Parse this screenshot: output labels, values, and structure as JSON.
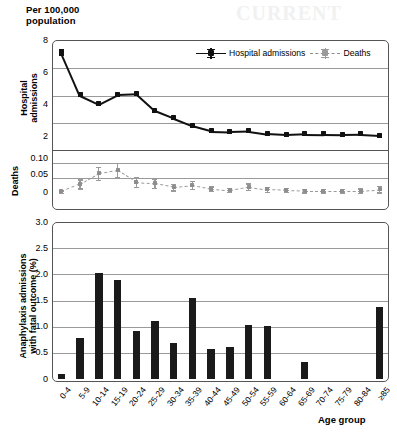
{
  "header": {
    "line1": "Per 100,000",
    "line2": "population"
  },
  "axis_titles": {
    "top_left": "Hospital\nadmissions",
    "hospital_line1": "Hospital",
    "hospital_line2": "admissions",
    "deaths": "Deaths",
    "bottom_left_line1": "Anaphylaxis admissions",
    "bottom_left_line2": "with fatal outcome (%)",
    "xaxis": "Age group"
  },
  "legend": {
    "hospital": "Hospital admissions",
    "deaths": "Deaths"
  },
  "colors": {
    "hospital_series": "#111111",
    "deaths_series": "#8e8e8e",
    "bars": "#1a1a1a",
    "grid": "#9a9a9a",
    "frame": "#555555",
    "background": "#ffffff"
  },
  "categories": [
    "0-4",
    "5-9",
    "10-14",
    "15-19",
    "20-24",
    "25-29",
    "30-34",
    "35-39",
    "40-44",
    "45-49",
    "50-54",
    "55-59",
    "60-64",
    "65-69",
    "70-74",
    "75-79",
    "80-84",
    "≥85"
  ],
  "ticks": {
    "hospital": [
      "8",
      "6",
      "4",
      "2"
    ],
    "deaths": [
      "0.10",
      "0.05",
      "0"
    ],
    "fatal": [
      "3.0",
      "2.5",
      "2.0",
      "1.5",
      "1.0",
      "0.5",
      "0"
    ]
  },
  "chart_data": [
    {
      "type": "line",
      "title": "Hospital admissions per 100,000 population",
      "ylabel": "Hospital admissions",
      "xlabel": "Age group",
      "ylim": [
        0,
        8
      ],
      "yticks": [
        0,
        2,
        4,
        6,
        8
      ],
      "grid": true,
      "legend_position": "top-right",
      "categories": [
        "0-4",
        "5-9",
        "10-14",
        "15-19",
        "20-24",
        "25-29",
        "30-34",
        "35-39",
        "40-44",
        "45-49",
        "50-54",
        "55-59",
        "60-64",
        "65-69",
        "70-74",
        "75-79",
        "80-84",
        "≥85"
      ],
      "series": [
        {
          "name": "Hospital admissions",
          "color": "#111111",
          "style": "solid",
          "values": [
            7.2,
            4.05,
            3.4,
            4.1,
            4.15,
            2.9,
            2.35,
            1.8,
            1.42,
            1.38,
            1.42,
            1.22,
            1.15,
            1.2,
            1.18,
            1.16,
            1.18,
            1.1
          ],
          "errors": [
            0.18,
            0.1,
            0.1,
            0.1,
            0.1,
            0.08,
            0.08,
            0.07,
            0.06,
            0.06,
            0.06,
            0.06,
            0.06,
            0.06,
            0.06,
            0.07,
            0.08,
            0.1
          ]
        }
      ]
    },
    {
      "type": "line",
      "title": "Deaths per 100,000 population",
      "ylabel": "Deaths",
      "xlabel": "Age group",
      "ylim": [
        0,
        0.125
      ],
      "yticks": [
        0,
        0.05,
        0.1
      ],
      "grid": true,
      "categories": [
        "0-4",
        "5-9",
        "10-14",
        "15-19",
        "20-24",
        "25-29",
        "30-34",
        "35-39",
        "40-44",
        "45-49",
        "50-54",
        "55-59",
        "60-64",
        "65-69",
        "70-74",
        "75-79",
        "80-84",
        "≥85"
      ],
      "series": [
        {
          "name": "Deaths",
          "color": "#8e8e8e",
          "style": "dashed",
          "values": [
            0.005,
            0.03,
            0.065,
            0.075,
            0.037,
            0.032,
            0.02,
            0.026,
            0.014,
            0.01,
            0.021,
            0.012,
            0.01,
            0.008,
            0.008,
            0.008,
            0.008,
            0.013
          ],
          "errors": [
            0.004,
            0.015,
            0.022,
            0.024,
            0.017,
            0.015,
            0.011,
            0.013,
            0.008,
            0.007,
            0.011,
            0.008,
            0.007,
            0.006,
            0.006,
            0.006,
            0.007,
            0.011
          ]
        }
      ]
    },
    {
      "type": "bar",
      "title": "Anaphylaxis admissions with fatal outcome (%)",
      "ylabel": "Anaphylaxis admissions with fatal outcome (%)",
      "xlabel": "Age group",
      "ylim": [
        0,
        3.0
      ],
      "yticks": [
        0,
        0.5,
        1.0,
        1.5,
        2.0,
        2.5,
        3.0
      ],
      "grid": true,
      "categories": [
        "0-4",
        "5-9",
        "10-14",
        "15-19",
        "20-24",
        "25-29",
        "30-34",
        "35-39",
        "40-44",
        "45-49",
        "50-54",
        "55-59",
        "60-64",
        "65-69",
        "70-74",
        "75-79",
        "80-84",
        "≥85"
      ],
      "values": [
        0.1,
        0.78,
        2.02,
        1.89,
        0.91,
        1.11,
        0.68,
        1.54,
        0.58,
        0.62,
        1.04,
        1.01,
        0.0,
        0.33,
        0.0,
        0.0,
        0.0,
        1.37
      ],
      "color": "#1a1a1a"
    }
  ]
}
